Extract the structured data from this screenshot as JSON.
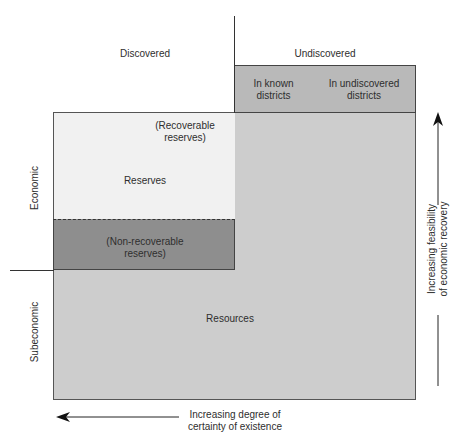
{
  "diagram": {
    "title": "",
    "column_headers": {
      "discovered": "Discovered",
      "undiscovered": "Undiscovered",
      "in_known_districts": "In known\ndistricts",
      "in_undiscovered_districts": "In undiscovered\ndistricts"
    },
    "row_labels": {
      "economic": "Economic",
      "subeconomic": "Subeconomic"
    },
    "regions": {
      "recoverable_reserves": "(Recoverable\nreserves)",
      "reserves": "Reserves",
      "non_recoverable_reserves": "(Non-recoverable\nreserves)",
      "resources": "Resources"
    },
    "axes": {
      "horizontal_arrow_label": "Increasing degree of\ncertainty of existence",
      "vertical_arrow_label": "Increasing feasibility\nof economic recovery"
    },
    "colors": {
      "reserves_fill": "#f1f1f1",
      "non_recoverable_fill": "#8e8e8e",
      "resources_fill": "#cdcdcd",
      "header_fill": "#b9b9b9",
      "line": "#333333"
    }
  }
}
